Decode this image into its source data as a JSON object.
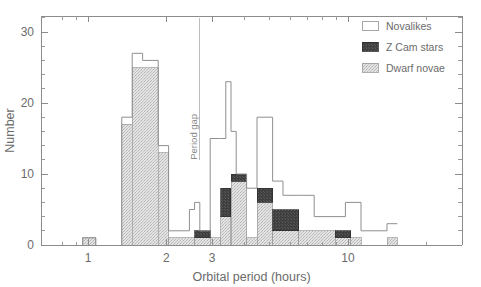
{
  "figure": {
    "background": "#ffffff",
    "frame_color": "#8c8c8c"
  },
  "annotations": {
    "period_gap_label": "Period gap"
  },
  "legend": {
    "position": "top-right",
    "entries": [
      {
        "label": "Novalikes",
        "swatch": "open",
        "fill": "#ffffff",
        "stroke": "#8f8f8f"
      },
      {
        "label": "Z Cam stars",
        "swatch": "solid",
        "fill": "#3b3b3b",
        "stroke": "#2c2c2c"
      },
      {
        "label": "Dwarf novae",
        "swatch": "stippled",
        "fill": "#d9d9d9",
        "stroke": "#9a9a9a"
      }
    ]
  },
  "chart_data": {
    "type": "bar",
    "title": "",
    "xlabel": "Orbital period (hours)",
    "ylabel": "Number",
    "xscale": "log",
    "yscale": "linear",
    "xlim": [
      0.72,
      22.0
    ],
    "ylim": [
      0,
      32
    ],
    "grid": false,
    "legend_position": "top-right",
    "stacked": true,
    "xticks": [
      1,
      2,
      3,
      10
    ],
    "xticklabels": [
      "1",
      "2",
      "3",
      "10"
    ],
    "xminorticks": [
      0.8,
      0.9,
      4,
      5,
      6,
      7,
      8,
      9,
      20
    ],
    "yticks": [
      0,
      10,
      20,
      30
    ],
    "yticklabels": [
      "0",
      "10",
      "20",
      "30"
    ],
    "yminortick_step": 2,
    "bin_width_dex": 0.05,
    "bin_edges_hours": [
      0.955,
      1.072,
      1.349,
      1.413,
      1.479,
      1.549,
      1.622,
      1.698,
      1.778,
      1.862,
      1.95,
      2.042,
      2.138,
      2.239,
      2.344,
      2.455,
      2.57,
      2.692,
      2.818,
      2.951,
      3.09,
      3.236,
      3.388,
      3.548,
      3.715,
      3.89,
      4.074,
      4.266,
      4.467,
      4.677,
      4.898,
      5.129,
      5.37,
      5.623,
      5.888,
      6.166,
      6.457,
      6.761,
      7.079,
      7.413,
      7.762,
      8.128,
      8.511,
      8.913,
      9.333,
      9.772,
      10.233,
      10.715,
      11.22,
      11.749,
      12.303,
      12.882,
      13.49,
      14.125,
      14.791,
      15.488,
      16.218
    ],
    "series": [
      {
        "name": "Dwarf novae",
        "fill": "#d9d9d9",
        "stroke": "#9a9a9a",
        "bins": [
          {
            "lo": 0.955,
            "hi": 1.072,
            "value": 1
          },
          {
            "lo": 1.349,
            "hi": 1.479,
            "value": 17
          },
          {
            "lo": 1.479,
            "hi": 1.862,
            "value": 25
          },
          {
            "lo": 1.862,
            "hi": 2.042,
            "value": 13
          },
          {
            "lo": 2.042,
            "hi": 2.57,
            "value": 1
          },
          {
            "lo": 2.57,
            "hi": 2.951,
            "value": 1
          },
          {
            "lo": 2.951,
            "hi": 3.236,
            "value": 1
          },
          {
            "lo": 3.236,
            "hi": 3.548,
            "value": 4
          },
          {
            "lo": 3.548,
            "hi": 4.074,
            "value": 9
          },
          {
            "lo": 4.074,
            "hi": 4.467,
            "value": 1
          },
          {
            "lo": 4.467,
            "hi": 5.129,
            "value": 6
          },
          {
            "lo": 5.129,
            "hi": 6.457,
            "value": 2
          },
          {
            "lo": 6.457,
            "hi": 8.913,
            "value": 2
          },
          {
            "lo": 8.913,
            "hi": 10.233,
            "value": 1
          },
          {
            "lo": 10.233,
            "hi": 11.22,
            "value": 1
          },
          {
            "lo": 14.125,
            "hi": 15.488,
            "value": 1
          }
        ]
      },
      {
        "name": "Z Cam stars",
        "fill": "#3b3b3b",
        "stroke": "#2c2c2c",
        "bins": [
          {
            "lo": 2.57,
            "hi": 2.951,
            "base": 1,
            "value": 2
          },
          {
            "lo": 3.236,
            "hi": 3.548,
            "base": 4,
            "value": 8
          },
          {
            "lo": 3.548,
            "hi": 4.074,
            "base": 9,
            "value": 10
          },
          {
            "lo": 4.467,
            "hi": 5.129,
            "base": 6,
            "value": 8
          },
          {
            "lo": 5.129,
            "hi": 6.457,
            "base": 2,
            "value": 5
          },
          {
            "lo": 6.457,
            "hi": 8.913,
            "base": 2,
            "value": 2
          },
          {
            "lo": 8.913,
            "hi": 10.233,
            "base": 1,
            "value": 2
          }
        ]
      },
      {
        "name": "Novalikes",
        "fill": "#ffffff",
        "stroke": "#8f8f8f",
        "bins": [
          {
            "lo": 0.955,
            "hi": 1.072,
            "value": 1
          },
          {
            "lo": 1.349,
            "hi": 1.479,
            "value": 18
          },
          {
            "lo": 1.479,
            "hi": 1.622,
            "value": 27
          },
          {
            "lo": 1.622,
            "hi": 1.862,
            "value": 26
          },
          {
            "lo": 1.862,
            "hi": 2.042,
            "value": 14
          },
          {
            "lo": 2.042,
            "hi": 2.455,
            "value": 2
          },
          {
            "lo": 2.455,
            "hi": 2.57,
            "value": 5
          },
          {
            "lo": 2.57,
            "hi": 2.692,
            "value": 6
          },
          {
            "lo": 2.692,
            "hi": 2.951,
            "value": 2
          },
          {
            "lo": 2.951,
            "hi": 3.236,
            "value": 15
          },
          {
            "lo": 3.236,
            "hi": 3.388,
            "value": 15
          },
          {
            "lo": 3.388,
            "hi": 3.548,
            "value": 23
          },
          {
            "lo": 3.548,
            "hi": 3.715,
            "value": 16
          },
          {
            "lo": 3.715,
            "hi": 4.074,
            "value": 10
          },
          {
            "lo": 4.074,
            "hi": 4.467,
            "value": 8
          },
          {
            "lo": 4.467,
            "hi": 5.129,
            "value": 18
          },
          {
            "lo": 5.129,
            "hi": 5.623,
            "value": 9
          },
          {
            "lo": 5.623,
            "hi": 6.457,
            "value": 7
          },
          {
            "lo": 6.457,
            "hi": 7.413,
            "value": 7
          },
          {
            "lo": 7.413,
            "hi": 8.913,
            "value": 4
          },
          {
            "lo": 8.913,
            "hi": 9.772,
            "value": 4
          },
          {
            "lo": 9.772,
            "hi": 11.22,
            "value": 6
          },
          {
            "lo": 11.22,
            "hi": 14.125,
            "value": 2
          },
          {
            "lo": 14.125,
            "hi": 15.488,
            "value": 3
          }
        ]
      }
    ],
    "period_gap": {
      "label": "Period gap",
      "x_hours": 2.69
    }
  }
}
